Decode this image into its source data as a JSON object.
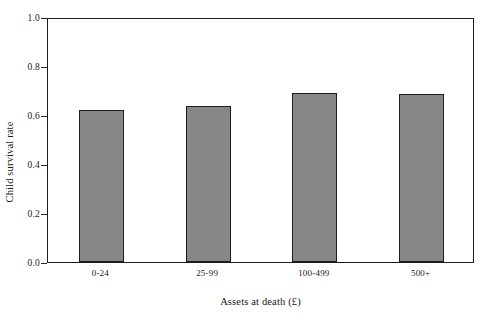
{
  "chart_data": {
    "type": "bar",
    "title": "",
    "xlabel": "Assets at death (£)",
    "ylabel": "Child survival rate",
    "categories": [
      "0-24",
      "25-99",
      "100-499",
      "500+"
    ],
    "values": [
      0.62,
      0.635,
      0.69,
      0.685
    ],
    "series": [
      {
        "name": "Child survival rate",
        "values": [
          0.62,
          0.635,
          0.69,
          0.685
        ]
      }
    ],
    "ylim": [
      0.0,
      1.0
    ],
    "ytick_labels": [
      "0.0",
      "0.2",
      "0.4",
      "0.6",
      "0.8",
      "1.0"
    ],
    "ytick_values": [
      0.0,
      0.2,
      0.4,
      0.6,
      0.8,
      1.0
    ],
    "grid": false,
    "legend": "none",
    "bar_fill_color": "#878787",
    "bar_edge_color": "#1d1d1d",
    "frame_color": "#1d1d1d",
    "background_color": "#ffffff"
  }
}
